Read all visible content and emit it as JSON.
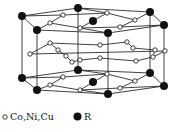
{
  "legend": [
    {
      "symbol": "open-circle",
      "label": "Co,Ni,Cu"
    },
    {
      "symbol": "filled-circle",
      "label": "R"
    }
  ],
  "colors": {
    "line": "#111111",
    "atom_R": "#111111",
    "atom_TM": "#ffffff",
    "background": "#ffffff"
  },
  "layers": {
    "top": {
      "R_atoms": [
        [
          22,
          16
        ],
        [
          78,
          8
        ],
        [
          150,
          12
        ],
        [
          164,
          25
        ],
        [
          108,
          33
        ],
        [
          37,
          30
        ]
      ],
      "R_center": [
        93,
        21
      ],
      "TM_atoms": [
        [
          63,
          15
        ],
        [
          50,
          23
        ],
        [
          107,
          13
        ],
        [
          120,
          27
        ],
        [
          135,
          20
        ],
        [
          80,
          28
        ]
      ]
    },
    "middle": {
      "TM_atoms": [
        [
          30,
          54
        ],
        [
          50,
          43
        ],
        [
          58,
          50
        ],
        [
          66,
          56
        ],
        [
          72,
          62
        ],
        [
          100,
          58
        ],
        [
          127,
          42
        ],
        [
          133,
          48
        ],
        [
          153,
          57
        ],
        [
          155,
          50
        ],
        [
          165,
          51
        ],
        [
          136,
          61
        ],
        [
          100,
          45
        ],
        [
          80,
          60
        ]
      ]
    },
    "bottom": {
      "R_atoms": [
        [
          22,
          78
        ],
        [
          78,
          70
        ],
        [
          150,
          73
        ],
        [
          164,
          86
        ],
        [
          108,
          94
        ],
        [
          37,
          90
        ]
      ],
      "R_center": [
        93,
        82
      ],
      "TM_atoms": [
        [
          63,
          77
        ],
        [
          50,
          85
        ],
        [
          107,
          74
        ],
        [
          120,
          88
        ],
        [
          135,
          81
        ],
        [
          80,
          90
        ]
      ]
    }
  }
}
